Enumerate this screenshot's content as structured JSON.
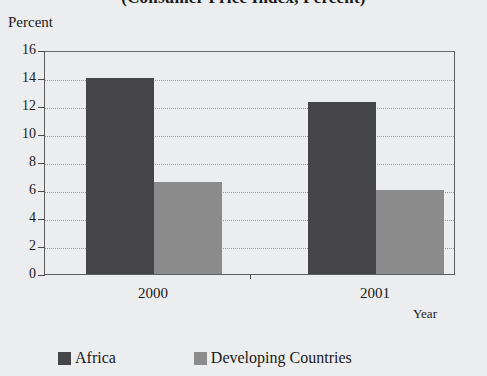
{
  "chart_data": {
    "type": "bar",
    "title": "(Consumer Price Index, Percent)",
    "ylabel": "Percent",
    "xlabel": "Year",
    "categories": [
      "2000",
      "2001"
    ],
    "series": [
      {
        "name": "Africa",
        "color": "#454547",
        "values": [
          14.0,
          12.3
        ]
      },
      {
        "name": "Developing Countries",
        "color": "#8b8b8b",
        "values": [
          6.6,
          6.0
        ]
      }
    ],
    "ylim": [
      0,
      16
    ],
    "ytick_step": 2,
    "yticks": [
      "16",
      "14",
      "12",
      "10",
      "8",
      "6",
      "4",
      "2",
      "0"
    ],
    "grid": true,
    "grid_axis": "y",
    "legend_position": "bottom"
  },
  "legend": {
    "entries": [
      {
        "label": "Africa"
      },
      {
        "label": "Developing Countries"
      }
    ]
  }
}
